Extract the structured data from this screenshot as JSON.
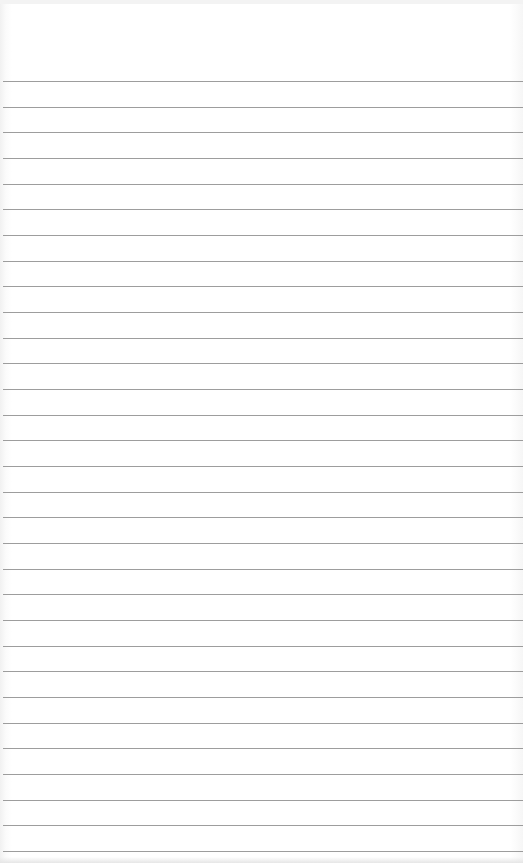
{
  "image": {
    "subject": "blank ruled notebook paper",
    "background_color": "#ffffff",
    "rule_color": "#8c8c8c",
    "rule_count": 31,
    "first_rule_y": 81,
    "rule_spacing_px": 25.67
  }
}
